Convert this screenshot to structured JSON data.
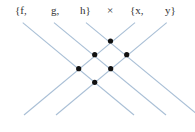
{
  "diagram": {
    "title_labels": [
      {
        "text": "{f,",
        "x": 15,
        "y": 14
      },
      {
        "text": "g,",
        "x": 51,
        "y": 14
      },
      {
        "text": "h}",
        "x": 80,
        "y": 14
      },
      {
        "text": "×",
        "x": 107,
        "y": 14
      },
      {
        "text": "{x,",
        "x": 130,
        "y": 14
      },
      {
        "text": "y}",
        "x": 165,
        "y": 14
      }
    ],
    "line_color": "#a9bfd6",
    "dot_color": "#111111",
    "lines": [
      {
        "name": "f",
        "x1": 22.7,
        "y1": 22.7,
        "x2": 134,
        "y2": 115
      },
      {
        "name": "g",
        "x1": 54,
        "y1": 22.7,
        "x2": 166,
        "y2": 115
      },
      {
        "name": "h",
        "x1": 86,
        "y1": 22.7,
        "x2": 198,
        "y2": 115
      },
      {
        "name": "x",
        "x1": 135,
        "y1": 22.7,
        "x2": 24,
        "y2": 115
      },
      {
        "name": "y",
        "x1": 166.7,
        "y1": 22.7,
        "x2": 56,
        "y2": 115
      }
    ],
    "intersections": [
      {
        "pair": "h×x",
        "cx": 110.5,
        "cy": 41
      },
      {
        "pair": "g×x",
        "cx": 94.7,
        "cy": 54.7
      },
      {
        "pair": "h×y",
        "cx": 126.7,
        "cy": 54.7
      },
      {
        "pair": "f×x",
        "cx": 78.7,
        "cy": 68.7
      },
      {
        "pair": "g×y",
        "cx": 110.7,
        "cy": 68.7
      },
      {
        "pair": "f×y",
        "cx": 94.7,
        "cy": 82.3
      }
    ]
  }
}
